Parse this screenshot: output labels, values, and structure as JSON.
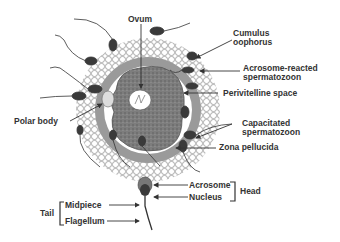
{
  "diagram": {
    "labels": {
      "ovum": "Ovum",
      "cumulus_1": "Cumulus",
      "cumulus_2": "oophorus",
      "acrosome_reacted_1": "Acrosome-reacted",
      "acrosome_reacted_2": "spermatozoon",
      "perivitelline": "Perivitelline space",
      "polar_body": "Polar body",
      "capacitated_1": "Capacitated",
      "capacitated_2": "spermatozoon",
      "zona": "Zona pellucida",
      "acrosome": "Acrosome",
      "nucleus": "Nucleus",
      "head": "Head",
      "tail": "Tail",
      "midpiece": "Midpiece",
      "flagellum": "Flagellum"
    },
    "colors": {
      "zona": "#9a9a9a",
      "ovum": "#7a7a7a",
      "sperm": "#3a3a3a",
      "text": "#333333"
    }
  }
}
